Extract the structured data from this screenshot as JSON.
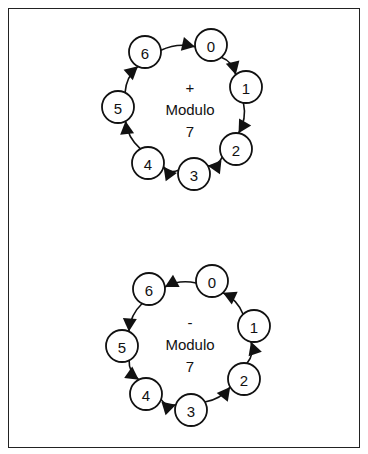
{
  "figure": {
    "frame": {
      "x": 8,
      "y": 8,
      "width": 352,
      "height": 440
    },
    "diagrams": [
      {
        "id": "addition",
        "operator": "+",
        "label": "Modulo",
        "modulus": "7",
        "direction": "clockwise",
        "center": {
          "x": 190,
          "y": 110
        },
        "nodes": [
          {
            "value": "0",
            "x": 211,
            "y": 45
          },
          {
            "value": "1",
            "x": 246,
            "y": 87
          },
          {
            "value": "2",
            "x": 236,
            "y": 149
          },
          {
            "value": "3",
            "x": 194,
            "y": 174
          },
          {
            "value": "4",
            "x": 148,
            "y": 163
          },
          {
            "value": "5",
            "x": 118,
            "y": 107
          },
          {
            "value": "6",
            "x": 145,
            "y": 52
          }
        ],
        "edges": [
          [
            "0",
            "1"
          ],
          [
            "1",
            "2"
          ],
          [
            "2",
            "3"
          ],
          [
            "3",
            "4"
          ],
          [
            "4",
            "5"
          ],
          [
            "5",
            "6"
          ],
          [
            "6",
            "0"
          ]
        ]
      },
      {
        "id": "subtraction",
        "operator": "-",
        "label": "Modulo",
        "modulus": "7",
        "direction": "counter-clockwise",
        "center": {
          "x": 190,
          "y": 345
        },
        "nodes": [
          {
            "value": "0",
            "x": 212,
            "y": 281
          },
          {
            "value": "1",
            "x": 254,
            "y": 326
          },
          {
            "value": "2",
            "x": 244,
            "y": 379
          },
          {
            "value": "3",
            "x": 191,
            "y": 410
          },
          {
            "value": "4",
            "x": 146,
            "y": 394
          },
          {
            "value": "5",
            "x": 122,
            "y": 346
          },
          {
            "value": "6",
            "x": 149,
            "y": 289
          }
        ],
        "edges": [
          [
            "0",
            "6"
          ],
          [
            "6",
            "5"
          ],
          [
            "5",
            "4"
          ],
          [
            "4",
            "3"
          ],
          [
            "3",
            "2"
          ],
          [
            "2",
            "1"
          ],
          [
            "1",
            "0"
          ]
        ]
      }
    ],
    "style": {
      "stroke": "#111111",
      "background": "#ffffff",
      "node_radius": 16
    }
  }
}
